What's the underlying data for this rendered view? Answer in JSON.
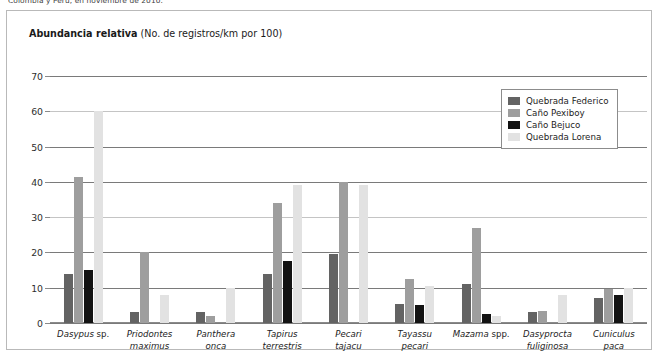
{
  "caption_top": "Colombia y Perú, en noviembre de 2010.",
  "chart_title": {
    "bold": "Abundancia relativa",
    "normal": " (No. de registros/km por 100)"
  },
  "legend": {
    "items": [
      {
        "label": "Quebrada Federico",
        "color": "#636363"
      },
      {
        "label": "Caño Pexiboy",
        "color": "#9e9e9e"
      },
      {
        "label": "Caño Bejuco",
        "color": "#121212"
      },
      {
        "label": "Quebrada Lorena",
        "color": "#e2e2e2"
      }
    ]
  },
  "chart_data": {
    "type": "bar",
    "title": "Abundancia relativa (No. de registros/km por 100)",
    "xlabel": "",
    "ylabel": "",
    "ylim": [
      0,
      70
    ],
    "yticks": [
      0,
      10,
      20,
      30,
      40,
      50,
      60,
      70
    ],
    "grid": true,
    "legend_position": "top-right",
    "categories": [
      "Dasypus sp.",
      "Priodontes maximus",
      "Panthera onca",
      "Tapirus terrestris",
      "Pecari tajacu",
      "Tayassu pecari",
      "Mazama spp.",
      "Dasyprocta fuliginosa",
      "Cuniculus paca"
    ],
    "category_parts": [
      {
        "italic": "Dasypus",
        "roman": "sp.",
        "line2_italic": "",
        "line2_roman": ""
      },
      {
        "italic": "Priodontes",
        "roman": "",
        "line2_italic": "maximus",
        "line2_roman": ""
      },
      {
        "italic": "Panthera",
        "roman": "",
        "line2_italic": "onca",
        "line2_roman": ""
      },
      {
        "italic": "Tapirus",
        "roman": "",
        "line2_italic": "terrestris",
        "line2_roman": ""
      },
      {
        "italic": "Pecari",
        "roman": "",
        "line2_italic": "tajacu",
        "line2_roman": ""
      },
      {
        "italic": "Tayassu",
        "roman": "",
        "line2_italic": "pecari",
        "line2_roman": ""
      },
      {
        "italic": "Mazama",
        "roman": "spp.",
        "line2_italic": "",
        "line2_roman": ""
      },
      {
        "italic": "Dasyprocta",
        "roman": "",
        "line2_italic": "fuliginosa",
        "line2_roman": ""
      },
      {
        "italic": "Cuniculus",
        "roman": "",
        "line2_italic": "paca",
        "line2_roman": ""
      }
    ],
    "series": [
      {
        "name": "Quebrada Federico",
        "color": "#636363",
        "values": [
          14,
          3,
          3,
          14,
          19.5,
          5.5,
          11,
          3,
          7
        ]
      },
      {
        "name": "Caño Pexiboy",
        "color": "#9e9e9e",
        "values": [
          41.5,
          20,
          2,
          34,
          40,
          12.5,
          27,
          3.5,
          9.5
        ]
      },
      {
        "name": "Caño Bejuco",
        "color": "#121212",
        "values": [
          15,
          0,
          0,
          17.5,
          0,
          5,
          2.5,
          0,
          8
        ]
      },
      {
        "name": "Quebrada Lorena",
        "color": "#e2e2e2",
        "values": [
          60,
          8,
          10,
          39,
          39,
          10.5,
          2,
          8,
          10
        ]
      }
    ]
  }
}
